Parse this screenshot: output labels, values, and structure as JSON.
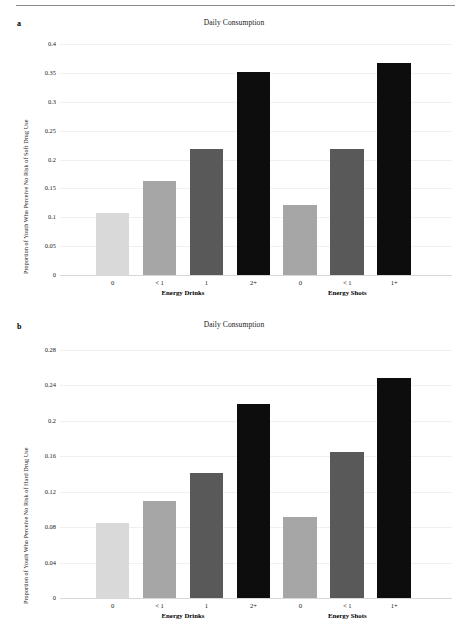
{
  "figure": {
    "panel_a_letter": "a",
    "panel_b_letter": "b",
    "rule_color": "#8a8a8a"
  },
  "palette": {
    "light": "#d9d9d9",
    "mid_light": "#a6a6a6",
    "dark": "#595959",
    "black": "#0d0d0d",
    "gridline": "#f0f0f0",
    "axis": "#d7d7d7",
    "text": "#1a1a1a"
  },
  "chart_data": [
    {
      "panel": "a",
      "type": "bar",
      "title": "Daily Consumption",
      "xlabel": "",
      "ylabel": "Proportion of Youth Who Perceive No Risk of Soft Drug Use",
      "categories": [
        "0",
        "< 1",
        "1",
        "2+",
        "0",
        "< 1",
        "1+"
      ],
      "values": [
        0.107,
        0.163,
        0.219,
        0.351,
        0.122,
        0.218,
        0.367
      ],
      "bar_colors": [
        "#d9d9d9",
        "#a6a6a6",
        "#595959",
        "#0d0d0d",
        "#a6a6a6",
        "#595959",
        "#0d0d0d"
      ],
      "ylim": [
        0,
        0.4
      ],
      "yticks": [
        "0",
        "0.05",
        "0.1",
        "0.15",
        "0.2",
        "0.25",
        "0.3",
        "0.35",
        "0.4"
      ],
      "ytick_values": [
        0,
        0.05,
        0.1,
        0.15,
        0.2,
        0.25,
        0.3,
        0.35,
        0.4
      ],
      "grid": true,
      "legend": "none",
      "groups": [
        {
          "label": "Energy Drinks",
          "start": 0,
          "end": 3
        },
        {
          "label": "Energy Shots",
          "start": 4,
          "end": 6
        }
      ]
    },
    {
      "panel": "b",
      "type": "bar",
      "title": "Daily Consumption",
      "xlabel": "",
      "ylabel": "Proportion of Youth Who Perceive No Risk of Hard Drug Use",
      "categories": [
        "0",
        "< 1",
        "1",
        "2+",
        "0",
        "< 1",
        "1+"
      ],
      "values": [
        0.085,
        0.109,
        0.141,
        0.219,
        0.092,
        0.165,
        0.248
      ],
      "bar_colors": [
        "#d9d9d9",
        "#a6a6a6",
        "#595959",
        "#0d0d0d",
        "#a6a6a6",
        "#595959",
        "#0d0d0d"
      ],
      "ylim": [
        0,
        0.28
      ],
      "yticks": [
        "0",
        "0.04",
        "0.08",
        "0.12",
        "0.16",
        "0.2",
        "0.24",
        "0.28"
      ],
      "ytick_values": [
        0,
        0.04,
        0.08,
        0.12,
        0.16,
        0.2,
        0.24,
        0.28
      ],
      "grid": true,
      "legend": "none",
      "groups": [
        {
          "label": "Energy Drinks",
          "start": 0,
          "end": 3
        },
        {
          "label": "Energy Shots",
          "start": 4,
          "end": 6
        }
      ]
    }
  ]
}
